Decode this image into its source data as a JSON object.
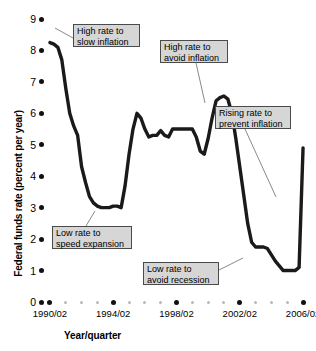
{
  "chart_data": {
    "type": "line",
    "title": "",
    "xlabel": "Year/quarter",
    "ylabel": "Federal funds rate (percent per year)",
    "ylim": [
      0,
      9
    ],
    "xlim": [
      1990.0,
      2006.5
    ],
    "grid": false,
    "legend": null,
    "y_ticks": [
      "9",
      "8",
      "7",
      "6",
      "5",
      "4",
      "3",
      "2",
      "1",
      "0"
    ],
    "y_tick_values": [
      9,
      8,
      7,
      6,
      5,
      4,
      3,
      2,
      1,
      0
    ],
    "x_ticks": [
      "1990/02",
      "1994/02",
      "1998/02",
      "2002/02",
      "2006/02"
    ],
    "x_tick_values": [
      1990.25,
      1994.25,
      1998.25,
      2002.25,
      2006.25
    ],
    "series": [
      {
        "name": "Federal funds rate",
        "color": "#1a1a1a",
        "x": [
          1990.25,
          1990.5,
          1990.75,
          1991.0,
          1991.25,
          1991.5,
          1991.75,
          1992.0,
          1992.25,
          1992.5,
          1992.75,
          1993.0,
          1993.25,
          1993.5,
          1993.75,
          1994.0,
          1994.25,
          1994.5,
          1994.75,
          1995.0,
          1995.25,
          1995.5,
          1995.75,
          1996.0,
          1996.25,
          1996.5,
          1996.75,
          1997.0,
          1997.25,
          1997.5,
          1997.75,
          1998.0,
          1998.25,
          1998.5,
          1998.75,
          1999.0,
          1999.25,
          1999.5,
          1999.75,
          2000.0,
          2000.25,
          2000.5,
          2000.75,
          2001.0,
          2001.25,
          2001.5,
          2001.75,
          2002.0,
          2002.25,
          2002.5,
          2002.75,
          2003.0,
          2003.25,
          2003.5,
          2003.75,
          2004.0,
          2004.25,
          2004.5,
          2004.75,
          2005.0,
          2005.25,
          2005.5,
          2005.75,
          2006.0,
          2006.25
        ],
        "y": [
          8.25,
          8.2,
          8.1,
          7.7,
          6.8,
          6.0,
          5.6,
          5.3,
          4.3,
          3.8,
          3.35,
          3.15,
          3.05,
          3.0,
          3.0,
          3.0,
          3.05,
          3.05,
          3.0,
          3.7,
          4.7,
          5.5,
          6.0,
          5.85,
          5.5,
          5.25,
          5.3,
          5.3,
          5.45,
          5.3,
          5.25,
          5.5,
          5.5,
          5.5,
          5.5,
          5.5,
          5.5,
          5.25,
          4.8,
          4.7,
          5.2,
          5.85,
          6.4,
          6.5,
          6.55,
          6.45,
          6.0,
          5.2,
          4.3,
          3.4,
          2.5,
          1.9,
          1.75,
          1.75,
          1.75,
          1.7,
          1.5,
          1.3,
          1.15,
          1.0,
          1.0,
          1.0,
          1.0,
          1.1,
          4.9
        ]
      }
    ],
    "annotations": [
      {
        "id": "high-rate-slow-inflation",
        "text": "High rate to\nslow inflation",
        "box": {
          "left": 73,
          "top": 24,
          "width": 67,
          "height": 23
        },
        "leader": {
          "x1": 73,
          "y1": 38,
          "x2": 55,
          "y2": 28
        }
      },
      {
        "id": "high-rate-avoid-inflation",
        "text": "High rate to\navoid inflation",
        "box": {
          "left": 160,
          "top": 40,
          "width": 68,
          "height": 23
        },
        "leader": {
          "x1": 196,
          "y1": 63,
          "x2": 205,
          "y2": 103
        }
      },
      {
        "id": "rising-rate-prevent-inflation",
        "text": "Rising rate to\nprevent inflation",
        "box": {
          "left": 215,
          "top": 106,
          "width": 76,
          "height": 23
        },
        "leader": {
          "x1": 245,
          "y1": 129,
          "x2": 276,
          "y2": 197
        }
      },
      {
        "id": "low-rate-speed-expansion",
        "text": "Low rate to\nspeed expansion",
        "box": {
          "left": 52,
          "top": 226,
          "width": 80,
          "height": 23
        },
        "leader": {
          "x1": 86,
          "y1": 226,
          "x2": 95,
          "y2": 211
        }
      },
      {
        "id": "low-rate-avoid-recession",
        "text": "Low rate to\navoid recession",
        "box": {
          "left": 143,
          "top": 262,
          "width": 76,
          "height": 23
        },
        "leader": {
          "x1": 219,
          "y1": 270,
          "x2": 243,
          "y2": 258
        }
      }
    ]
  },
  "axis": {
    "x_title": "Year/quarter",
    "y_title": "Federal funds rate (percent per year)"
  },
  "colors": {
    "line": "#1a1a1a",
    "callout_fill": "#d6d6d6",
    "callout_border": "#4a4a4a",
    "tick_major": "#111111",
    "tick_minor": "#b9b9b9",
    "background": "#ffffff"
  }
}
